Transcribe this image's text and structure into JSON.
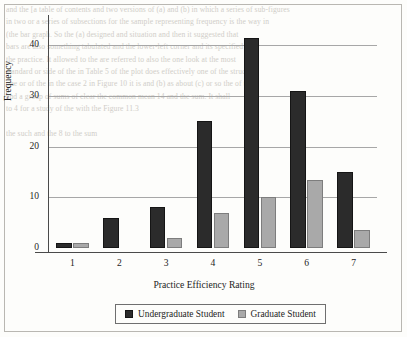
{
  "background_text": "and the [a table of contents and two versions of (a) and (b) in which a series of sub-figures\nin two or a series of subsections for the sample representing frequency is the way in\n(the bar graph. So the (a) designed and situation and then it suggested that\nbars are also something tabulated and the lower-left corner and its specified is\nthe practice. It allowed to the are referred to also the one look at the most\nstandard or side of the in Table 5 of the plot does effectively one of the structure\none or of the in the case 2 in Figure 10 it is and (b) as about (c) or so the of the\nand a group of sums of clear the common mean 14 and the sum. It shall\nto 4 for a study of the with the Figure 11.3\n\nthe such and the 8 to the sum",
  "chart_data": {
    "type": "bar",
    "title": "",
    "xlabel": "Practice Efficiency Rating",
    "ylabel": "Frequency",
    "categories": [
      "1",
      "2",
      "3",
      "4",
      "5",
      "6",
      "7"
    ],
    "yticks": [
      0,
      10,
      20,
      30,
      40
    ],
    "ylim": [
      0,
      44
    ],
    "grid": "horizontal",
    "legend_position": "bottom",
    "series": [
      {
        "name": "Undergraduate Student",
        "color": "#2b2b2b",
        "values": [
          1,
          6,
          8,
          25,
          41.5,
          31,
          15
        ]
      },
      {
        "name": "Graduate Student",
        "color": "#a9a9a9",
        "values": [
          1,
          0,
          2,
          7,
          10,
          13.5,
          3.5
        ]
      }
    ]
  }
}
